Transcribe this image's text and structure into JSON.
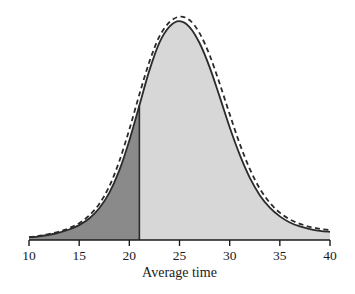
{
  "chart_data": {
    "type": "area",
    "title": "",
    "subtitle": "",
    "xlabel": "Average time",
    "ylabel": "",
    "xlim": [
      10,
      40
    ],
    "ylim": [
      0,
      1.06
    ],
    "grid": false,
    "legend": "none",
    "xticks": [
      10,
      15,
      20,
      25,
      30,
      35,
      40
    ],
    "xticklabels": [
      "10",
      "15",
      "20",
      "25",
      "30",
      "35",
      "40"
    ],
    "yticks": [],
    "yticklabels": [],
    "annotations": [
      {
        "name": "shaded-region-divider",
        "type": "vertical-line",
        "x": 21,
        "description": "boundary between dark-shaded left area and light-shaded right area"
      }
    ],
    "series": [
      {
        "name": "solid-density-curve",
        "style": "solid",
        "filled": true,
        "fill_left_of_21": "#8a8a8a",
        "fill_right_of_21": "#d7d7d7",
        "line_color": "#2b2b2b",
        "x": [
          10,
          11,
          12,
          13,
          14,
          15,
          16,
          17,
          18,
          19,
          20,
          21,
          22,
          23,
          24,
          25,
          26,
          27,
          28,
          29,
          30,
          31,
          32,
          33,
          34,
          35,
          36,
          37,
          38,
          39,
          40
        ],
        "y": [
          0.012,
          0.017,
          0.024,
          0.034,
          0.048,
          0.068,
          0.098,
          0.145,
          0.215,
          0.318,
          0.455,
          0.615,
          0.775,
          0.902,
          0.975,
          1.0,
          0.973,
          0.9,
          0.79,
          0.655,
          0.515,
          0.39,
          0.285,
          0.205,
          0.148,
          0.108,
          0.08,
          0.062,
          0.05,
          0.042,
          0.037
        ]
      },
      {
        "name": "dashed-density-curve",
        "style": "dashed",
        "filled": false,
        "line_color": "#2b2b2b",
        "x": [
          10,
          11,
          12,
          13,
          14,
          15,
          16,
          17,
          18,
          19,
          20,
          21,
          22,
          23,
          24,
          25,
          26,
          27,
          28,
          29,
          30,
          31,
          32,
          33,
          34,
          35,
          36,
          37,
          38,
          39,
          40
        ],
        "y": [
          0.013,
          0.019,
          0.027,
          0.038,
          0.054,
          0.077,
          0.112,
          0.165,
          0.245,
          0.36,
          0.505,
          0.665,
          0.815,
          0.93,
          0.995,
          1.02,
          1.005,
          0.945,
          0.845,
          0.715,
          0.575,
          0.44,
          0.325,
          0.235,
          0.17,
          0.125,
          0.094,
          0.074,
          0.06,
          0.051,
          0.045
        ]
      }
    ]
  },
  "axis": {
    "title": "Average time",
    "tick_labels": [
      "10",
      "15",
      "20",
      "25",
      "30",
      "35",
      "40"
    ]
  },
  "colors": {
    "dark_fill": "#8a8a8a",
    "light_fill": "#d7d7d7",
    "curve_stroke": "#2b2b2b",
    "axis_stroke": "#1a1a1a",
    "background": "#ffffff"
  }
}
